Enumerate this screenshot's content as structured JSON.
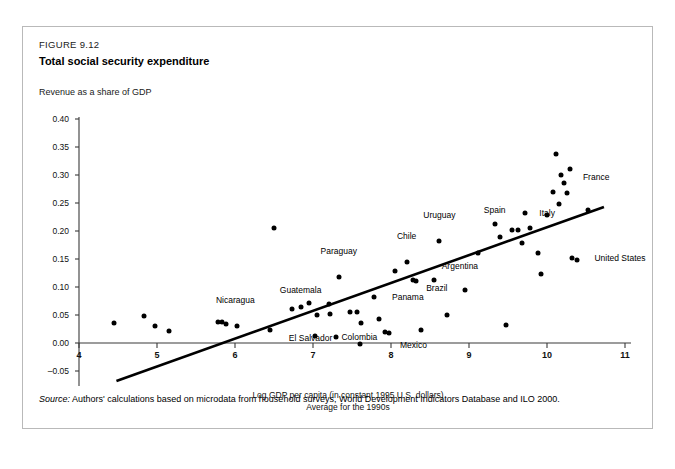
{
  "figure": {
    "number": "FIGURE 9.12",
    "title": "Total social security expenditure",
    "y_axis_title": "Revenue as a share of GDP",
    "x_axis_caption_line1": "Log GDP per capita (in constant 1995 U.S. dollars)",
    "x_axis_caption_line2": "Average for the 1990s",
    "source_label": "Source:",
    "source_text": "Authors' calculations based on microdata from household surveys, World Development Indicators Database and ILO 2000."
  },
  "chart_data": {
    "type": "scatter",
    "title": "Total social security expenditure",
    "xlabel": "Log GDP per capita (in constant 1995 U.S. dollars) Average for the 1990s",
    "ylabel": "Revenue as a share of GDP",
    "xlim": [
      4,
      11
    ],
    "ylim": [
      -0.05,
      0.4
    ],
    "xticks": [
      "4",
      "5",
      "6",
      "7",
      "8",
      "9",
      "10",
      "11"
    ],
    "yticks": [
      "-0.05",
      "0.00",
      "0.05",
      "0.10",
      "0.15",
      "0.20",
      "0.25",
      "0.30",
      "0.35",
      "0.40"
    ],
    "grid": false,
    "legend": "none",
    "marker_color": "#000000",
    "trendline": {
      "label": "linear fit",
      "x_start": 4.48,
      "y_start": -0.068,
      "x_end": 10.73,
      "y_end": 0.243,
      "color": "#000000"
    },
    "points": [
      {
        "x": 4.45,
        "y": 0.035,
        "label": ""
      },
      {
        "x": 4.83,
        "y": 0.049,
        "label": ""
      },
      {
        "x": 4.98,
        "y": 0.03,
        "label": ""
      },
      {
        "x": 5.15,
        "y": 0.022,
        "label": ""
      },
      {
        "x": 5.78,
        "y": 0.038,
        "label": ""
      },
      {
        "x": 5.83,
        "y": 0.037,
        "label": ""
      },
      {
        "x": 5.88,
        "y": 0.034,
        "label": ""
      },
      {
        "x": 6.03,
        "y": 0.031,
        "label": "Nicaragua",
        "label_dx": -2,
        "label_dy": -26
      },
      {
        "x": 6.5,
        "y": 0.205,
        "label": ""
      },
      {
        "x": 6.45,
        "y": 0.024,
        "label": ""
      },
      {
        "x": 6.73,
        "y": 0.06,
        "label": ""
      },
      {
        "x": 6.85,
        "y": 0.065,
        "label": ""
      },
      {
        "x": 6.95,
        "y": 0.072,
        "label": ""
      },
      {
        "x": 7.02,
        "y": 0.013,
        "label": "El Salvador",
        "label_dx": -4,
        "label_dy": 2
      },
      {
        "x": 7.05,
        "y": 0.05,
        "label": ""
      },
      {
        "x": 7.2,
        "y": 0.069,
        "label": "Guatemala",
        "label_dx": -28,
        "label_dy": -14
      },
      {
        "x": 7.22,
        "y": 0.052,
        "label": ""
      },
      {
        "x": 7.3,
        "y": 0.011,
        "label": ""
      },
      {
        "x": 7.33,
        "y": 0.118,
        "label": "Paraguay",
        "label_dx": 0,
        "label_dy": -26
      },
      {
        "x": 7.48,
        "y": 0.056,
        "label": ""
      },
      {
        "x": 7.56,
        "y": 0.056,
        "label": ""
      },
      {
        "x": 7.6,
        "y": -0.002,
        "label": ""
      },
      {
        "x": 7.62,
        "y": 0.036,
        "label": "Colombia",
        "label_dx": -2,
        "label_dy": 14
      },
      {
        "x": 7.78,
        "y": 0.082,
        "label": "Panama",
        "label_dx": 34,
        "label_dy": 0
      },
      {
        "x": 7.85,
        "y": 0.042,
        "label": ""
      },
      {
        "x": 7.92,
        "y": 0.02,
        "label": ""
      },
      {
        "x": 7.98,
        "y": 0.018,
        "label": "Mexico",
        "label_dx": 24,
        "label_dy": 12
      },
      {
        "x": 8.05,
        "y": 0.128,
        "label": ""
      },
      {
        "x": 8.2,
        "y": 0.144,
        "label": "Chile",
        "label_dx": 0,
        "label_dy": -26
      },
      {
        "x": 8.28,
        "y": 0.112,
        "label": "Brazil",
        "label_dx": 24,
        "label_dy": 8
      },
      {
        "x": 8.32,
        "y": 0.11,
        "label": ""
      },
      {
        "x": 8.38,
        "y": 0.023,
        "label": ""
      },
      {
        "x": 8.55,
        "y": 0.113,
        "label": "Argentina",
        "label_dx": 26,
        "label_dy": -14
      },
      {
        "x": 8.62,
        "y": 0.182,
        "label": "Uruguay",
        "label_dx": 0,
        "label_dy": -26
      },
      {
        "x": 8.72,
        "y": 0.05,
        "label": ""
      },
      {
        "x": 8.95,
        "y": 0.095,
        "label": ""
      },
      {
        "x": 9.12,
        "y": 0.16,
        "label": ""
      },
      {
        "x": 9.33,
        "y": 0.212,
        "label": "Spain",
        "label_dx": 0,
        "label_dy": -14
      },
      {
        "x": 9.4,
        "y": 0.19,
        "label": ""
      },
      {
        "x": 9.48,
        "y": 0.033,
        "label": ""
      },
      {
        "x": 9.55,
        "y": 0.202,
        "label": ""
      },
      {
        "x": 9.63,
        "y": 0.202,
        "label": ""
      },
      {
        "x": 9.68,
        "y": 0.178,
        "label": ""
      },
      {
        "x": 9.72,
        "y": 0.232,
        "label": "Italy",
        "label_dx": 22,
        "label_dy": 0
      },
      {
        "x": 9.78,
        "y": 0.205,
        "label": ""
      },
      {
        "x": 9.88,
        "y": 0.16,
        "label": ""
      },
      {
        "x": 9.92,
        "y": 0.124,
        "label": ""
      },
      {
        "x": 10.0,
        "y": 0.228,
        "label": ""
      },
      {
        "x": 10.08,
        "y": 0.27,
        "label": ""
      },
      {
        "x": 10.12,
        "y": 0.338,
        "label": ""
      },
      {
        "x": 10.15,
        "y": 0.248,
        "label": ""
      },
      {
        "x": 10.18,
        "y": 0.3,
        "label": ""
      },
      {
        "x": 10.22,
        "y": 0.285,
        "label": "France",
        "label_dx": 32,
        "label_dy": -6
      },
      {
        "x": 10.26,
        "y": 0.268,
        "label": ""
      },
      {
        "x": 10.3,
        "y": 0.31,
        "label": ""
      },
      {
        "x": 10.32,
        "y": 0.152,
        "label": "United States",
        "label_dx": 48,
        "label_dy": 0
      },
      {
        "x": 10.38,
        "y": 0.148,
        "label": ""
      },
      {
        "x": 10.52,
        "y": 0.238,
        "label": ""
      }
    ]
  }
}
